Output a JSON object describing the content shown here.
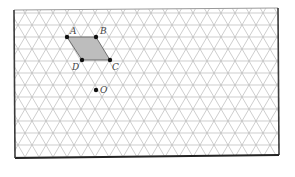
{
  "diagram": {
    "type": "isometric-grid-figure",
    "frame": {
      "top_left": [
        14,
        10
      ],
      "top_right": [
        278,
        8
      ],
      "bottom_right": [
        279,
        155
      ],
      "bottom_left": [
        15,
        158
      ]
    },
    "grid": {
      "row_spacing": 12,
      "triangle_side": 14,
      "first_row_y": 13,
      "line_color": "#b9b9b9"
    },
    "shape": {
      "name": "parallelogram ABCD",
      "fill": "#bdbdbd",
      "vertices": [
        "A",
        "B",
        "C",
        "D"
      ]
    },
    "points": [
      {
        "label": "A",
        "x": 67,
        "y": 37,
        "label_dx": 3,
        "label_dy": -3
      },
      {
        "label": "B",
        "x": 96,
        "y": 37,
        "label_dx": 4,
        "label_dy": -3
      },
      {
        "label": "C",
        "x": 110,
        "y": 60,
        "label_dx": 2,
        "label_dy": 10
      },
      {
        "label": "D",
        "x": 82,
        "y": 60,
        "label_dx": -10,
        "label_dy": 10
      },
      {
        "label": "O",
        "x": 96,
        "y": 90,
        "label_dx": 4,
        "label_dy": 3
      }
    ]
  }
}
